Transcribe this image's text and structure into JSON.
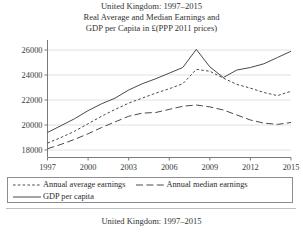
{
  "figure": {
    "title_lines": [
      "United Kingdom: 1997–2015",
      "Real Average and Median Earnings and",
      "GDP per Capita in £(PPP 2011 prices)"
    ],
    "caption": "United Kingdom: 1997–2015"
  },
  "legend": {
    "items": [
      {
        "label": "Annual average earnings",
        "style": "fine-dashed",
        "color": "#4a4a4a"
      },
      {
        "label": "Annual median earnings",
        "style": "long-dashed",
        "color": "#4a4a4a"
      },
      {
        "label": "GDP per capita",
        "style": "solid",
        "color": "#4a4a4a"
      }
    ]
  },
  "chart_data": {
    "type": "line",
    "xlabel": "",
    "ylabel": "",
    "x": [
      1997,
      1998,
      1999,
      2000,
      2001,
      2002,
      2003,
      2004,
      2005,
      2006,
      2007,
      2008,
      2009,
      2010,
      2011,
      2012,
      2013,
      2014,
      2015
    ],
    "xlim": [
      1997,
      2015
    ],
    "ylim": [
      17400,
      26800
    ],
    "xticks": [
      1997,
      2000,
      2003,
      2006,
      2009,
      2012,
      2015
    ],
    "yticks": [
      18000,
      20000,
      22000,
      24000,
      26000
    ],
    "ytick_labels": [
      "18000",
      "20000",
      "22000",
      "24000",
      "26000"
    ],
    "grid": true,
    "legend_position": "below-axes",
    "series": [
      {
        "name": "GDP per capita",
        "style": "solid",
        "color": "#4a4a4a",
        "values": [
          19400,
          19950,
          20500,
          21150,
          21700,
          22150,
          22800,
          23300,
          23700,
          24150,
          24600,
          26050,
          24650,
          23800,
          24400,
          24600,
          24900,
          25400,
          25900
        ]
      },
      {
        "name": "Annual average earnings",
        "style": "fine-dashed",
        "color": "#4a4a4a",
        "values": [
          18550,
          19000,
          19500,
          20100,
          20700,
          21250,
          21750,
          22150,
          22550,
          22900,
          23300,
          24450,
          24300,
          23750,
          23250,
          22950,
          22600,
          22350,
          22700
        ]
      },
      {
        "name": "Annual median earnings",
        "style": "long-dashed",
        "color": "#4a4a4a",
        "values": [
          18100,
          18450,
          18850,
          19300,
          19800,
          20250,
          20700,
          20950,
          21000,
          21250,
          21500,
          21600,
          21450,
          21200,
          20800,
          20400,
          20150,
          20050,
          20200
        ]
      }
    ]
  }
}
